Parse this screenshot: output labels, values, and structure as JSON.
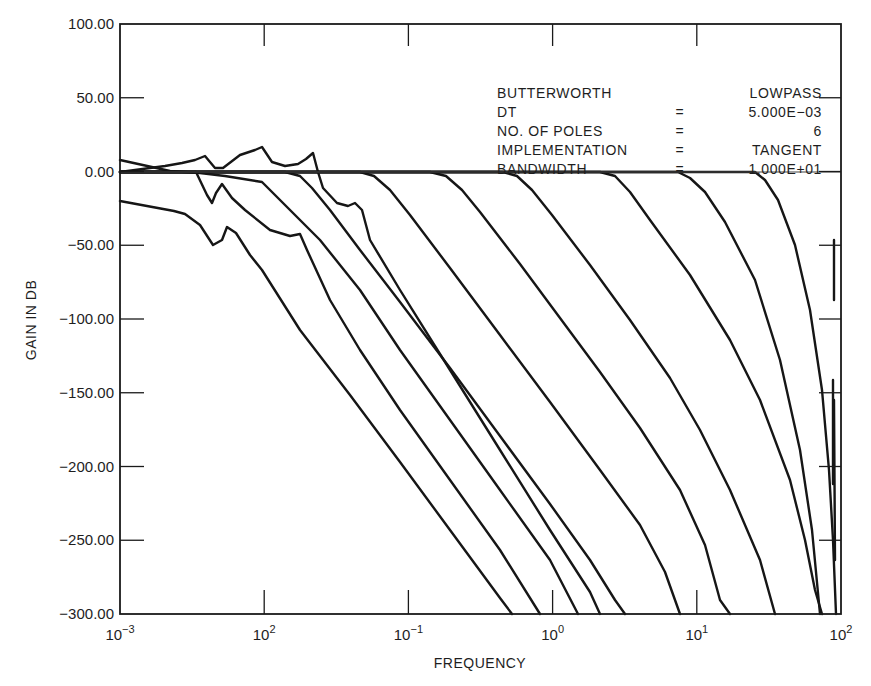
{
  "chart_data": {
    "type": "line",
    "title": "",
    "xlabel": "FREQUENCY",
    "ylabel": "GAIN IN DB",
    "xscale": "log",
    "x_tick_labels": [
      {
        "base": "10",
        "exp": "−3"
      },
      {
        "base": "10",
        "exp": "2"
      },
      {
        "base": "10",
        "exp": "−1"
      },
      {
        "base": "10",
        "exp": "0"
      },
      {
        "base": "10",
        "exp": "1"
      },
      {
        "base": "10",
        "exp": "2"
      }
    ],
    "x_tick_values": [
      0.001,
      0.01,
      0.1,
      1,
      10,
      100
    ],
    "y_tick_labels": [
      "100.00",
      "50.00",
      "0.00",
      "−50.00",
      "−100.00",
      "−150.00",
      "−200.00",
      "−250.00",
      "−300.00"
    ],
    "ylim": [
      -300,
      100
    ],
    "xlim": [
      0.001,
      100
    ],
    "grid": false,
    "zero_reference_line": true,
    "annotation": {
      "rows": [
        {
          "label": "BUTTERWORTH",
          "eq": "",
          "value": "LOWPASS"
        },
        {
          "label": "DT",
          "eq": "=",
          "value": "5.000E−03"
        },
        {
          "label": "NO. OF POLES",
          "eq": "=",
          "value": "6"
        },
        {
          "label": "IMPLEMENTATION",
          "eq": "=",
          "value": "TANGENT"
        },
        {
          "label": "BANDWIDTH",
          "eq": "=",
          "value": "1.000E+01"
        }
      ]
    },
    "series": [
      {
        "name": "response-1",
        "cutoff_approx": 0.0015,
        "points": [
          [
            0.001,
            -20
          ],
          [
            0.0022,
            -25
          ],
          [
            0.003,
            -35
          ],
          [
            0.0038,
            -45
          ],
          [
            0.0045,
            -30
          ],
          [
            0.006,
            -45
          ],
          [
            0.01,
            -90
          ],
          [
            0.1,
            -240
          ],
          [
            0.2,
            -300
          ]
        ]
      },
      {
        "name": "response-2",
        "cutoff_approx": 0.003,
        "points": [
          [
            0.001,
            0
          ],
          [
            0.0028,
            0
          ],
          [
            0.0038,
            -20
          ],
          [
            0.0045,
            -5
          ],
          [
            0.008,
            -40
          ],
          [
            0.02,
            -45
          ],
          [
            0.1,
            -180
          ],
          [
            0.5,
            -300
          ]
        ]
      },
      {
        "name": "response-3",
        "cutoff_approx": 0.004,
        "points": [
          [
            0.001,
            8
          ],
          [
            0.002,
            0
          ],
          [
            0.004,
            -5
          ],
          [
            0.01,
            -15
          ],
          [
            0.03,
            -40
          ],
          [
            0.1,
            -110
          ],
          [
            0.6,
            -300
          ]
        ]
      },
      {
        "name": "response-4",
        "cutoff_approx": 0.01,
        "points": [
          [
            0.001,
            0
          ],
          [
            0.002,
            5
          ],
          [
            0.0035,
            12
          ],
          [
            0.005,
            3
          ],
          [
            0.008,
            15
          ],
          [
            0.01,
            18
          ],
          [
            0.014,
            5
          ],
          [
            0.02,
            3
          ],
          [
            0.025,
            18
          ],
          [
            0.03,
            0
          ],
          [
            0.04,
            -15
          ],
          [
            0.06,
            -30
          ],
          [
            0.065,
            -25
          ],
          [
            0.08,
            -60
          ],
          [
            0.3,
            -200
          ],
          [
            0.9,
            -300
          ]
        ]
      },
      {
        "name": "response-5",
        "cutoff_approx": 0.06,
        "points": [
          [
            0.001,
            0
          ],
          [
            0.06,
            0
          ],
          [
            0.1,
            -25
          ],
          [
            0.3,
            -120
          ],
          [
            1.0,
            -230
          ],
          [
            1.8,
            -300
          ]
        ]
      },
      {
        "name": "response-6",
        "cutoff_approx": 0.2,
        "points": [
          [
            0.001,
            0
          ],
          [
            0.2,
            0
          ],
          [
            0.35,
            -30
          ],
          [
            1,
            -130
          ],
          [
            3,
            -250
          ],
          [
            3.6,
            -300
          ]
        ]
      },
      {
        "name": "response-7",
        "cutoff_approx": 0.6,
        "points": [
          [
            0.001,
            0
          ],
          [
            0.6,
            0
          ],
          [
            1,
            -30
          ],
          [
            3,
            -130
          ],
          [
            5,
            -230
          ],
          [
            6.5,
            -300
          ]
        ]
      },
      {
        "name": "response-8",
        "cutoff_approx": 1.8,
        "points": [
          [
            0.001,
            0
          ],
          [
            1.8,
            0
          ],
          [
            3,
            -40
          ],
          [
            8,
            -170
          ],
          [
            12,
            -300
          ]
        ]
      },
      {
        "name": "response-9",
        "cutoff_approx": 5,
        "points": [
          [
            0.001,
            0
          ],
          [
            5,
            0
          ],
          [
            10,
            -60
          ],
          [
            25,
            -200
          ],
          [
            40,
            -300
          ]
        ]
      },
      {
        "name": "response-10",
        "cutoff_approx": 15,
        "points": [
          [
            0.001,
            0
          ],
          [
            15,
            0
          ],
          [
            30,
            -60
          ],
          [
            60,
            -200
          ],
          [
            75,
            -300
          ]
        ]
      },
      {
        "name": "response-11",
        "cutoff_approx": 40,
        "points": [
          [
            0.001,
            0
          ],
          [
            40,
            0
          ],
          [
            60,
            -60
          ],
          [
            80,
            -200
          ],
          [
            88,
            -300
          ]
        ]
      }
    ]
  },
  "plot": {
    "frame": {
      "x0": 120,
      "y0": 24,
      "x1": 841,
      "y1": 614
    },
    "curves_px": [
      "120,201 174,211 185,214 200,225 213,245 222,240 227,227 236,233 250,255 262,270 300,330 350,395 400,462 450,530 500,598 512,614",
      "120,172 180,172 196,172 207,195 212,203 216,193 222,184 232,198 245,210 270,230 290,236 300,234 307,250 330,300 360,350 400,410 450,480 500,550 540,614",
      "120,160 170,171 200,173 225,176 262,182 290,210 320,240 360,290 400,350 450,420 500,490 550,560 578,614",
      "120,172 165,166 182,163 195,160 205,156 215,168 223,168 240,155 255,150 262,147 272,162 285,166 298,164 306,159 313,153 318,172 323,188 337,203 348,206 355,203 362,210 370,240 400,290 450,370 500,450 550,530 590,592 600,614",
      "120,172 285,172 300,176 312,188 330,210 360,250 400,302 450,368 500,436 550,504 590,560 615,600 625,614",
      "120,172 360,172 374,176 390,190 410,215 450,268 500,335 550,402 600,470 640,525 665,572 680,614",
      "120,172 430,172 446,176 462,190 480,212 520,264 560,318 600,372 640,428 680,490 705,545 720,600 730,614",
      "120,172 503,172 517,176 532,190 552,215 590,265 630,320 670,378 700,430 730,490 760,560 775,614",
      "120,172 600,172 615,176 630,192 650,220 690,275 730,340 760,400 790,480 805,540 815,590 822,614",
      "120,172 678,172 690,178 705,192 725,222 755,280 780,360 800,450 812,530 820,614",
      "120,172 755,172 765,180 778,200 795,245 810,310 822,390 829,470 833,540 836,614"
    ],
    "right_edge_spikes": [
      "834,400 835,560",
      "833,380 833,484",
      "834,240 834,300"
    ]
  }
}
